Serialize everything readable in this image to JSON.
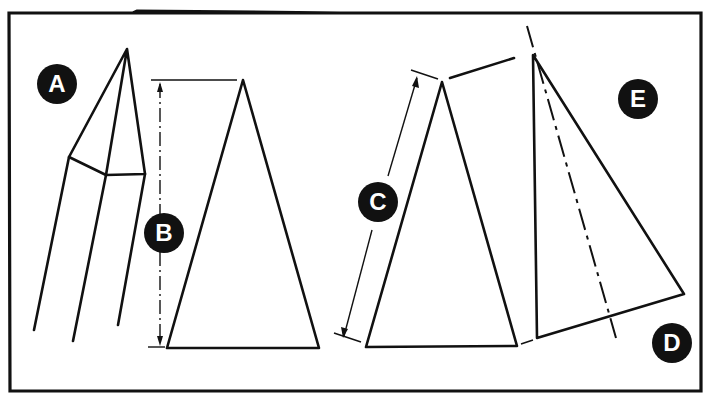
{
  "diagram": {
    "labels": {
      "A": "A",
      "B": "B",
      "C": "C",
      "D": "D",
      "E": "E"
    },
    "colors": {
      "ink": "#111111",
      "paper": "#ffffff"
    }
  }
}
